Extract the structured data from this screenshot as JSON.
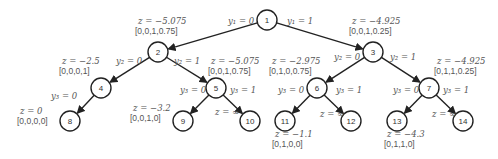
{
  "diagram": {
    "nodes": [
      {
        "id": "1",
        "x": 267,
        "y": 20
      },
      {
        "id": "2",
        "x": 158,
        "y": 52
      },
      {
        "id": "3",
        "x": 373,
        "y": 52
      },
      {
        "id": "4",
        "x": 101,
        "y": 88
      },
      {
        "id": "5",
        "x": 216,
        "y": 88
      },
      {
        "id": "6",
        "x": 317,
        "y": 88
      },
      {
        "id": "7",
        "x": 429,
        "y": 88
      },
      {
        "id": "8",
        "x": 70,
        "y": 121
      },
      {
        "id": "9",
        "x": 183,
        "y": 121
      },
      {
        "id": "10",
        "x": 250,
        "y": 121
      },
      {
        "id": "11",
        "x": 285,
        "y": 121
      },
      {
        "id": "12",
        "x": 351,
        "y": 121
      },
      {
        "id": "13",
        "x": 397,
        "y": 121
      },
      {
        "id": "14",
        "x": 463,
        "y": 121
      }
    ],
    "edges": [
      {
        "from": "1",
        "to": "2",
        "label": "y₁ = 0",
        "lx": 228,
        "ly": 24
      },
      {
        "from": "1",
        "to": "3",
        "label": "y₁ = 1",
        "lx": 287,
        "ly": 24
      },
      {
        "from": "2",
        "to": "4",
        "label": "y₂ = 0",
        "lx": 116,
        "ly": 64
      },
      {
        "from": "2",
        "to": "5",
        "label": "y₂ = 1",
        "lx": 174,
        "ly": 64
      },
      {
        "from": "3",
        "to": "6",
        "label": "y₂ = 0",
        "lx": 334,
        "ly": 60
      },
      {
        "from": "3",
        "to": "7",
        "label": "y₂ = 1",
        "lx": 390,
        "ly": 60
      },
      {
        "from": "4",
        "to": "8",
        "label": "y₃ = 0",
        "lx": 51,
        "ly": 99
      },
      {
        "from": "5",
        "to": "9",
        "label": "y₃ = 0",
        "lx": 180,
        "ly": 93
      },
      {
        "from": "5",
        "to": "10",
        "label": "y₃ = 1",
        "lx": 230,
        "ly": 93
      },
      {
        "from": "6",
        "to": "11",
        "label": "y₃ = 0",
        "lx": 278,
        "ly": 93
      },
      {
        "from": "6",
        "to": "12",
        "label": "y₃ = 1",
        "lx": 336,
        "ly": 93
      },
      {
        "from": "7",
        "to": "13",
        "label": "y₃ = 0",
        "lx": 393,
        "ly": 93
      },
      {
        "from": "7",
        "to": "14",
        "label": "y₃ = 1",
        "lx": 443,
        "ly": 93
      }
    ],
    "annotations": [
      {
        "node": "2",
        "z": "z = −5.075",
        "vec": "[0,0,1,0.75]",
        "x": 138,
        "y": 24
      },
      {
        "node": "3",
        "z": "z = −4.925",
        "vec": "[0,0,1,0.25]",
        "x": 352,
        "y": 24
      },
      {
        "node": "4",
        "z": "z = −2.5",
        "vec": "[0,0,0,1]",
        "x": 62,
        "y": 64
      },
      {
        "node": "5",
        "z": "z = −5.075",
        "vec": "[0,0,1,0.75]",
        "x": 211,
        "y": 64
      },
      {
        "node": "6",
        "z": "z = −2.975",
        "vec": "[0,1,0,0.75]",
        "x": 272,
        "y": 64
      },
      {
        "node": "7",
        "z": "z = −4.925",
        "vec": "[0,1,1,0.25]",
        "x": 437,
        "y": 64
      },
      {
        "node": "8",
        "z": "z = 0",
        "vec": "[0,0,0,0]",
        "x": 20,
        "y": 114
      },
      {
        "node": "9",
        "z": "z = −3.2",
        "vec": "[0,0,1,0]",
        "x": 133,
        "y": 111
      },
      {
        "node": "10",
        "z": "z = ∞",
        "vec": "",
        "x": 215,
        "y": 115
      },
      {
        "node": "11",
        "z": "z = −1.1",
        "vec": "[0,1,0,0]",
        "x": 275,
        "y": 137
      },
      {
        "node": "12",
        "z": "z = ∞",
        "vec": "",
        "x": 320,
        "y": 117
      },
      {
        "node": "13",
        "z": "z = −4.3",
        "vec": "[0,1,1,0]",
        "x": 387,
        "y": 137
      },
      {
        "node": "14",
        "z": "z = ∞",
        "vec": "",
        "x": 432,
        "y": 117
      }
    ]
  }
}
